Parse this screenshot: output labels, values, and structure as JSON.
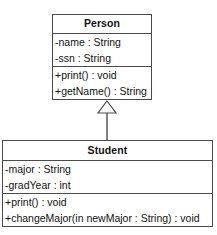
{
  "diagram": {
    "kind": "uml-class-diagram",
    "background_color": "#ffffff",
    "line_color": "#4a4a4a",
    "text_color": "#111111",
    "classes": [
      {
        "name": "Person",
        "attributes": [
          "-name : String",
          "-ssn : String"
        ],
        "operations": [
          "+print() : void",
          "+getName() : String"
        ]
      },
      {
        "name": "Student",
        "attributes": [
          "-major : String",
          "-gradYear : int"
        ],
        "operations": [
          "+print() : void",
          "+changeMajor(in newMajor : String) : void"
        ]
      }
    ],
    "relationships": [
      {
        "type": "generalization",
        "source": "Student",
        "target": "Person",
        "arrow": "hollow-triangle",
        "label": ""
      }
    ]
  }
}
